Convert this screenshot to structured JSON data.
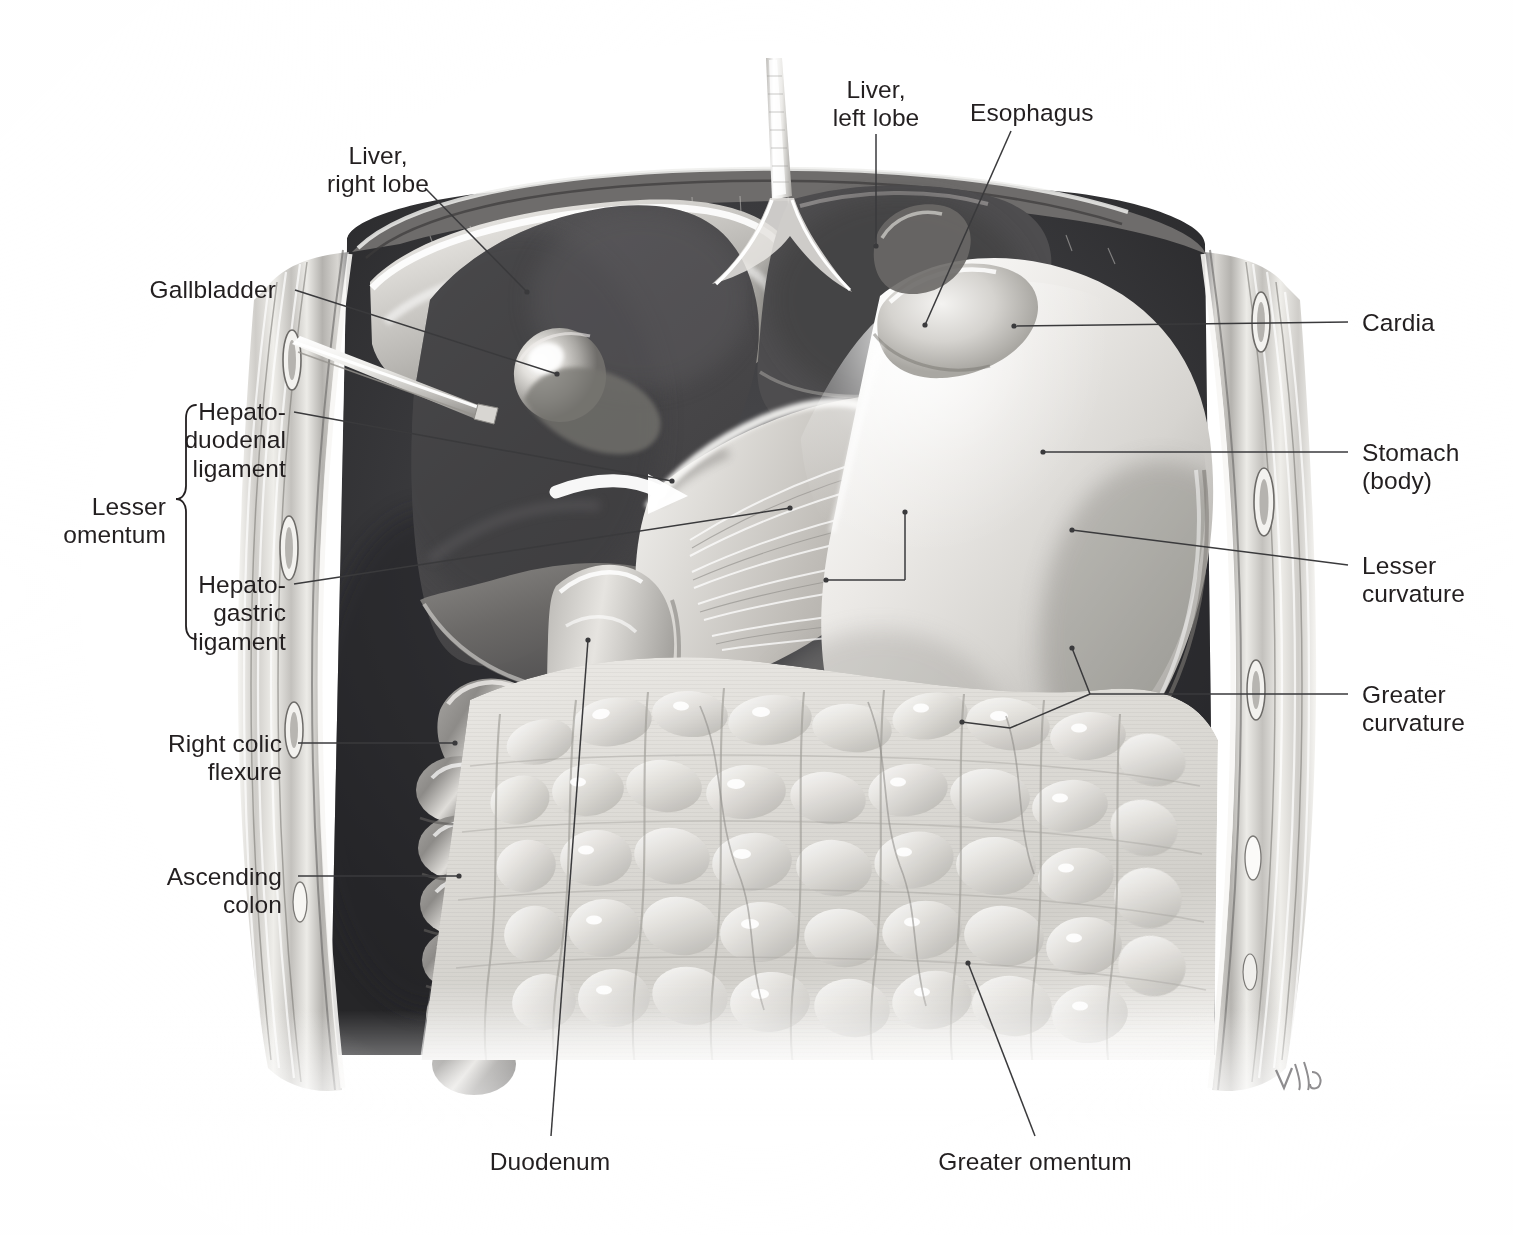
{
  "figure": {
    "type": "anatomical-illustration",
    "style": "grayscale airbrush medical illustration",
    "signature": "Voll",
    "background_color": "#ffffff",
    "ink_color": "#231f20",
    "leader_color": "#3a3a3c"
  },
  "labels": {
    "liver_right_lobe": "Liver,\nright lobe",
    "liver_left_lobe": "Liver,\nleft lobe",
    "esophagus": "Esophagus",
    "gallbladder": "Gallbladder",
    "cardia": "Cardia",
    "stomach_body": "Stomach\n(body)",
    "lesser_curvature": "Lesser\ncurvature",
    "greater_curvature": "Greater\ncurvature",
    "hepatoduodenal_ligament": "Hepato-\nduodenal\nligament",
    "hepatogastric_ligament": "Hepato-\ngastric\nligament",
    "lesser_omentum": "Lesser\nomentum",
    "right_colic_flexure": "Right colic\nflexure",
    "ascending_colon": "Ascending\ncolon",
    "duodenum": "Duodenum",
    "greater_omentum": "Greater omentum"
  },
  "structures": [
    {
      "name": "liver-right-lobe",
      "label_key": "liver_right_lobe"
    },
    {
      "name": "liver-left-lobe",
      "label_key": "liver_left_lobe"
    },
    {
      "name": "esophagus",
      "label_key": "esophagus"
    },
    {
      "name": "gallbladder",
      "label_key": "gallbladder"
    },
    {
      "name": "cardia",
      "label_key": "cardia"
    },
    {
      "name": "stomach-body",
      "label_key": "stomach_body"
    },
    {
      "name": "lesser-curvature",
      "label_key": "lesser_curvature"
    },
    {
      "name": "greater-curvature",
      "label_key": "greater_curvature"
    },
    {
      "name": "hepatoduodenal-ligament",
      "label_key": "hepatoduodenal_ligament"
    },
    {
      "name": "hepatogastric-ligament",
      "label_key": "hepatogastric_ligament"
    },
    {
      "name": "lesser-omentum",
      "label_key": "lesser_omentum"
    },
    {
      "name": "right-colic-flexure",
      "label_key": "right_colic_flexure"
    },
    {
      "name": "ascending-colon",
      "label_key": "ascending_colon"
    },
    {
      "name": "duodenum",
      "label_key": "duodenum"
    },
    {
      "name": "greater-omentum",
      "label_key": "greater_omentum"
    },
    {
      "name": "falciform-ligament",
      "label_key": null
    },
    {
      "name": "abdominal-wall",
      "label_key": null
    },
    {
      "name": "surgical-retractor",
      "label_key": null
    },
    {
      "name": "omental-foramen-arrow",
      "label_key": null
    }
  ],
  "bracket": {
    "name": "lesser-omentum-bracket",
    "groups": [
      "hepatoduodenal_ligament",
      "hepatogastric_ligament"
    ]
  }
}
